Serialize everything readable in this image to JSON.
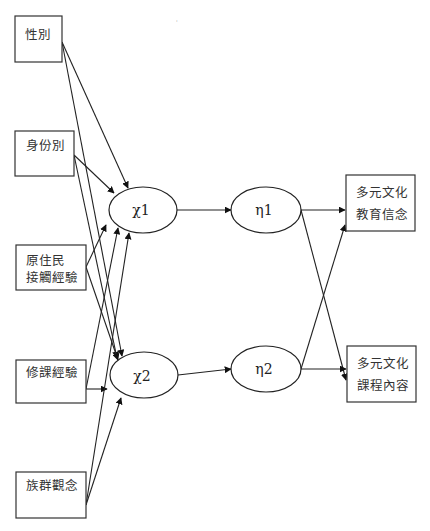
{
  "diagram": {
    "type": "path-model",
    "stray_mark": "ˌ",
    "observed_inputs": [
      {
        "id": "gender",
        "lines": [
          "性別"
        ]
      },
      {
        "id": "identity",
        "lines": [
          "身份別"
        ]
      },
      {
        "id": "indigenous_contact",
        "lines": [
          "原住民",
          "接觸經驗"
        ]
      },
      {
        "id": "course_experience",
        "lines": [
          "修課經驗"
        ]
      },
      {
        "id": "ethnic_concept",
        "lines": [
          "族群觀念"
        ]
      }
    ],
    "latent_exogenous": [
      {
        "id": "chi1",
        "label": "χ1"
      },
      {
        "id": "chi2",
        "label": "χ2"
      }
    ],
    "latent_endogenous": [
      {
        "id": "eta1",
        "label": "η1"
      },
      {
        "id": "eta2",
        "label": "η2"
      }
    ],
    "observed_outputs": [
      {
        "id": "mc_belief",
        "lines": [
          "多元文化",
          "教育信念"
        ]
      },
      {
        "id": "mc_curriculum",
        "lines": [
          "多元文化",
          "課程內容"
        ]
      }
    ],
    "edges": [
      {
        "from": "gender",
        "to": "chi1"
      },
      {
        "from": "gender",
        "to": "chi2"
      },
      {
        "from": "identity",
        "to": "chi1"
      },
      {
        "from": "identity",
        "to": "chi2"
      },
      {
        "from": "indigenous_contact",
        "to": "chi1"
      },
      {
        "from": "indigenous_contact",
        "to": "chi2"
      },
      {
        "from": "course_experience",
        "to": "chi1"
      },
      {
        "from": "course_experience",
        "to": "chi2"
      },
      {
        "from": "ethnic_concept",
        "to": "chi1"
      },
      {
        "from": "ethnic_concept",
        "to": "chi2"
      },
      {
        "from": "chi1",
        "to": "eta1"
      },
      {
        "from": "chi2",
        "to": "eta2"
      },
      {
        "from": "eta1",
        "to": "mc_belief"
      },
      {
        "from": "eta1",
        "to": "mc_curriculum"
      },
      {
        "from": "eta2",
        "to": "mc_belief"
      },
      {
        "from": "eta2",
        "to": "mc_curriculum"
      }
    ]
  }
}
